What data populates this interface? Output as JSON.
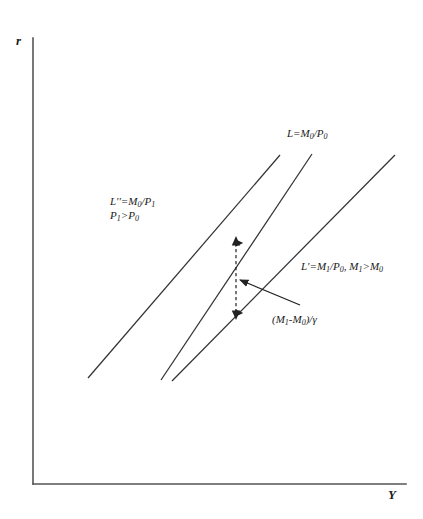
{
  "figure": {
    "axes": {
      "y_axis_label": "r",
      "x_axis_label": "Y",
      "axis_color": "#555555"
    },
    "curves": [
      {
        "id": "L",
        "label_html": "L=M<sub>0</sub>/P<sub>0</sub>",
        "label_plain": "L=M0/P0",
        "x1": 161,
        "y1": 380,
        "x2": 312,
        "y2": 154,
        "color": "#333333"
      },
      {
        "id": "L_double_prime",
        "label_line1_html": "L''=M<sub>0</sub>/P<sub>1</sub>",
        "label_line2_html": "P<sub>1</sub>>P<sub>0</sub>",
        "label_plain": "L''=M0/P1 ; P1>P0",
        "x1": 88,
        "y1": 378,
        "x2": 280,
        "y2": 155,
        "color": "#333333"
      },
      {
        "id": "L_prime",
        "label_html": "L'=M<sub>1</sub>/P<sub>0</sub>, M<sub>1</sub>>M<sub>0</sub>",
        "label_plain": "L'=M1/P0, M1>M0",
        "x1": 172,
        "y1": 381,
        "x2": 395,
        "y2": 155,
        "color": "#333333"
      }
    ],
    "shift_annotation": {
      "label_html": "(M<sub>1</sub>-M<sub>0</sub>)/&#947;",
      "label_plain": "(M1-M0)/gamma",
      "dashed_arrow": {
        "x": 236,
        "y_top": 238,
        "y_bottom": 318,
        "style": "double-headed dashed vertical"
      },
      "pointer_arrow": {
        "x_tail": 300,
        "y_tail": 305,
        "x_head": 233,
        "y_head": 277,
        "style": "solid diagonal"
      },
      "color": "#222222"
    },
    "background_color": "#ffffff"
  },
  "chart_data": {
    "type": "line",
    "title": "",
    "xlabel": "Y",
    "ylabel": "r",
    "grid": false,
    "legend": "inline-annotations",
    "xlim": [
      0,
      423
    ],
    "ylim": [
      0,
      519
    ],
    "series": [
      {
        "name": "L=M0/P0",
        "x": [
          161,
          312
        ],
        "y": [
          380,
          154
        ]
      },
      {
        "name": "L''=M0/P1",
        "x": [
          88,
          280
        ],
        "y": [
          378,
          155
        ]
      },
      {
        "name": "L'=M1/P0",
        "x": [
          172,
          395
        ],
        "y": [
          381,
          155
        ]
      }
    ],
    "annotations": [
      {
        "text": "L=M0/P0",
        "x": 287,
        "y": 126
      },
      {
        "text": "L''=M0/P1",
        "x": 110,
        "y": 194
      },
      {
        "text": "P1>P0",
        "x": 110,
        "y": 209
      },
      {
        "text": "L'=M1/P0, M1>M0",
        "x": 301,
        "y": 259
      },
      {
        "text": "(M1-M0)/gamma",
        "x": 272,
        "y": 312
      }
    ]
  }
}
